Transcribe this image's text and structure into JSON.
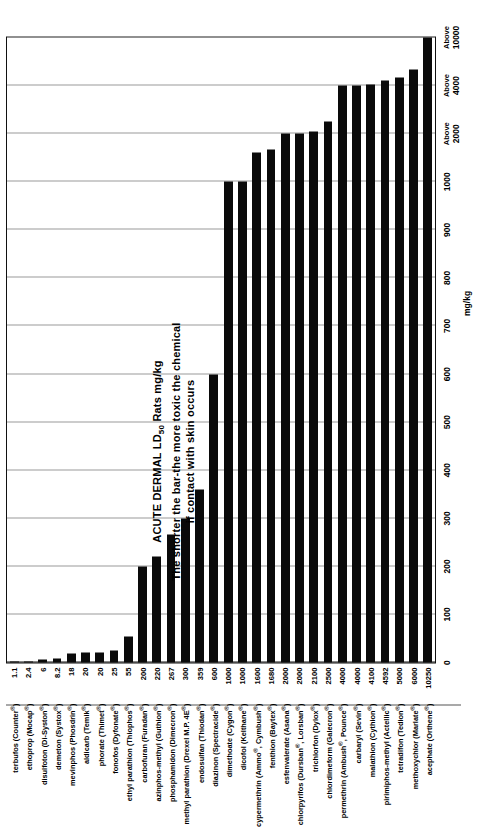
{
  "chart_data": {
    "type": "bar",
    "orientation": "horizontal",
    "title": "ACUTE DERMAL LD50 Rats mg/kg",
    "title_line1": "ACUTE DERMAL LD",
    "title_sub": "50",
    "title_line1_tail": " Rats mg/kg",
    "title_line2": "The shorter the bar-the more toxic the chemical",
    "title_line3": "if contact with skin occurs",
    "xlabel": "mg/kg",
    "ylabel": "",
    "grid": true,
    "legend": "none",
    "xlim": [
      0,
      1300
    ],
    "xticks": [
      {
        "value": 0,
        "label": "0",
        "above": ""
      },
      {
        "value": 100,
        "label": "100",
        "above": ""
      },
      {
        "value": 200,
        "label": "200",
        "above": ""
      },
      {
        "value": 300,
        "label": "300",
        "above": ""
      },
      {
        "value": 400,
        "label": "400",
        "above": ""
      },
      {
        "value": 500,
        "label": "500",
        "above": ""
      },
      {
        "value": 600,
        "label": "600",
        "above": ""
      },
      {
        "value": 700,
        "label": "700",
        "above": ""
      },
      {
        "value": 800,
        "label": "800",
        "above": ""
      },
      {
        "value": 900,
        "label": "900",
        "above": ""
      },
      {
        "value": 1000,
        "label": "1000",
        "above": ""
      },
      {
        "value": 1100,
        "label": "2000",
        "above": "Above"
      },
      {
        "value": 1200,
        "label": "4000",
        "above": "Above"
      },
      {
        "value": 1300,
        "label": "10000",
        "above": "Above"
      }
    ],
    "categories": [
      "terbufos (Counter®)",
      "ethoprop (Mocap®)",
      "disulfoton (Di-Syston®)",
      "demeton (Systox®)",
      "mevinphos (Phosdrin®)",
      "aldicarb (Temik®)",
      "phorate (Thimet®)",
      "fonofos (Dyfonate®)",
      "ethyl parathion (Thiophos®)",
      "carbofuran (Furadan®)",
      "azinphos-methyl (Guthion®)",
      "phosphamidon (Dimecron®)",
      "methyl parathion (Drexel M.P. 4E®)",
      "endosulfan (Thiodan®)",
      "diazinon (Spectracide®)",
      "dimethoate (Cygon®)",
      "dicofol (Kelthane®)",
      "cypermethrin (Ammo®, Cymbush®)",
      "fenthion (Baytex®)",
      "esfenvalerate (Asana®)",
      "chlorpyrifos (Dursban®, Lorsban®)",
      "trichlorfon (Dylox®)",
      "chlordimeform (Galecron®)",
      "permethrin (Ambush®, Pounce®)",
      "carbaryl (Sevin®)",
      "malathion (Cythion®)",
      "pirimiphos-methyl (Actellic®)",
      "tetradifon (Tedion®)",
      "methoxychlor (Marlate®)",
      "acephate (Orthene®)"
    ],
    "values": [
      1.1,
      2.4,
      6,
      8.2,
      18,
      20,
      20,
      25,
      55,
      200,
      220,
      267,
      300,
      359,
      600,
      1000,
      1000,
      1600,
      1680,
      2000,
      2000,
      2100,
      2500,
      4000,
      4000,
      4100,
      4592,
      5000,
      6000,
      10250
    ],
    "value_labels": [
      "1.1",
      "2.4",
      "6",
      "8.2",
      "18",
      "20",
      "20",
      "25",
      "55",
      "200",
      "220",
      "267",
      "300",
      "359",
      "600",
      "1000",
      "1000",
      "1600",
      "1680",
      "2000",
      "2000",
      "2100",
      "2500",
      "4000",
      "4000",
      "4100",
      "4592",
      "5000",
      "6000",
      "10250"
    ],
    "bar_color": "#0a0a0a",
    "grid_color": "#9a9a9a",
    "units": "mg/kg"
  }
}
